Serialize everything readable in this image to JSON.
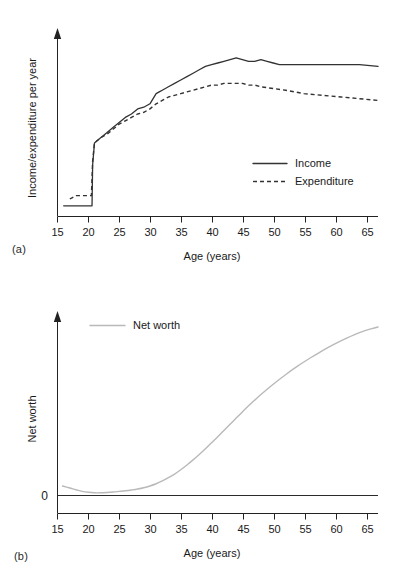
{
  "figure": {
    "panel_a_label": "(a)",
    "panel_b_label": "(b)"
  },
  "chart_data": [
    {
      "id": "panel-a",
      "type": "line",
      "title": "",
      "xlabel": "Age (years)",
      "ylabel": "Income/expenditure per year",
      "xlim": [
        15,
        67
      ],
      "ylim": [
        0,
        100
      ],
      "xticks": [
        15,
        20,
        25,
        30,
        35,
        40,
        45,
        50,
        55,
        60,
        65
      ],
      "xticklabels": [
        "15",
        "20",
        "25",
        "30",
        "35",
        "40",
        "45",
        "50",
        "55",
        "60",
        "65"
      ],
      "yticks": [],
      "yticklabels": [],
      "grid": false,
      "legend_position": "center-right",
      "series": [
        {
          "name": "Income",
          "style": "solid",
          "color": "#333333",
          "x": [
            16,
            17,
            18,
            19,
            20,
            20.6,
            20.7,
            21,
            22,
            23,
            24,
            25,
            26,
            27,
            28,
            29,
            30,
            31,
            31.5,
            32,
            33,
            34,
            35,
            36,
            37,
            38,
            39,
            40,
            41,
            42,
            43,
            44,
            45,
            46,
            47,
            48,
            49,
            50,
            51,
            52,
            55,
            58,
            61,
            64,
            67
          ],
          "y": [
            6,
            6,
            6,
            6,
            6,
            6,
            30,
            43,
            46,
            49,
            52,
            55,
            58,
            60,
            63,
            64,
            66,
            72,
            73,
            74,
            76,
            78,
            80,
            82,
            84,
            86,
            88,
            89,
            90,
            91,
            92,
            93,
            92,
            91,
            91,
            92,
            91,
            90,
            89,
            89,
            89,
            89,
            89,
            89,
            88
          ]
        },
        {
          "name": "Expenditure",
          "style": "dashed",
          "color": "#333333",
          "x": [
            17,
            18,
            19,
            20,
            20.5,
            20.7,
            21,
            22,
            23,
            24,
            25,
            26,
            27,
            28,
            29,
            30,
            31,
            32,
            33,
            34,
            35,
            36,
            37,
            38,
            39,
            40,
            41,
            42,
            43,
            44,
            45,
            46,
            47,
            48,
            50,
            52,
            55,
            58,
            61,
            64,
            67
          ],
          "y": [
            10,
            12,
            12,
            12,
            12,
            32,
            43,
            46,
            48,
            51,
            54,
            56,
            58,
            60,
            61,
            63,
            66,
            68,
            70,
            71,
            72,
            73,
            74,
            75,
            76,
            77,
            77,
            78,
            78,
            78,
            78,
            77,
            77,
            76,
            75,
            74,
            72,
            71,
            70,
            69,
            68
          ]
        }
      ]
    },
    {
      "id": "panel-b",
      "type": "line",
      "title": "",
      "xlabel": "Age (years)",
      "ylabel": "Net worth",
      "xlim": [
        15,
        67
      ],
      "ylim": [
        -6,
        100
      ],
      "xticks": [
        15,
        20,
        25,
        30,
        35,
        40,
        45,
        50,
        55,
        60,
        65
      ],
      "xticklabels": [
        "15",
        "20",
        "25",
        "30",
        "35",
        "40",
        "45",
        "50",
        "55",
        "60",
        "65"
      ],
      "yticks": [
        0
      ],
      "yticklabels": [
        "0"
      ],
      "grid": false,
      "zero_line": true,
      "legend_position": "upper-left",
      "series": [
        {
          "name": "Net worth",
          "style": "solid",
          "color": "#b9b9b9",
          "x": [
            15.8,
            17,
            18,
            19,
            20,
            21,
            22,
            23,
            24,
            25,
            26,
            27,
            28,
            29,
            30,
            31,
            32,
            33,
            34,
            35,
            36,
            37,
            38,
            39,
            40,
            41,
            42,
            43,
            44,
            45,
            46,
            47,
            48,
            50,
            52,
            54,
            56,
            58,
            60,
            62,
            64,
            66,
            67
          ],
          "y": [
            0,
            -1.3,
            -2.4,
            -3.4,
            -4.0,
            -4.3,
            -4.3,
            -4.1,
            -3.8,
            -3.4,
            -3.0,
            -2.5,
            -1.9,
            -1.1,
            0,
            1.4,
            3.2,
            5.2,
            7.5,
            10.2,
            13.2,
            16.4,
            19.8,
            23.4,
            27.2,
            31.0,
            34.9,
            38.8,
            42.7,
            46.6,
            50.4,
            54.0,
            57.5,
            64.0,
            70.0,
            75.5,
            80.5,
            85.2,
            89.4,
            93.2,
            96.5,
            99.0,
            100.0
          ]
        }
      ]
    }
  ],
  "panel_a": {
    "ylabel": "Income/expenditure per year",
    "xlabel": "Age (years)",
    "legend": [
      {
        "label": "Income",
        "style": "solid"
      },
      {
        "label": "Expenditure",
        "style": "dashed"
      }
    ],
    "xticklabels": [
      "15",
      "20",
      "25",
      "30",
      "35",
      "40",
      "45",
      "50",
      "55",
      "60",
      "65"
    ]
  },
  "panel_b": {
    "ylabel": "Net worth",
    "xlabel": "Age (years)",
    "zero_label": "0",
    "legend": [
      {
        "label": "Net worth",
        "style": "solid"
      }
    ],
    "xticklabels": [
      "15",
      "20",
      "25",
      "30",
      "35",
      "40",
      "45",
      "50",
      "55",
      "60",
      "65"
    ]
  }
}
